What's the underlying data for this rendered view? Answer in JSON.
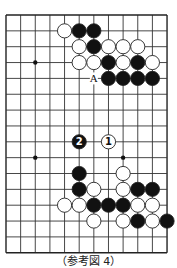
{
  "diagram": {
    "type": "go-board-fragment",
    "grid": {
      "columns": 12,
      "rows": 16,
      "origin_x": 6,
      "origin_y": 15,
      "step_x": 14.64,
      "step_y": 15.85,
      "line_color": "#333333",
      "border_color": "#222222"
    },
    "star_points": [
      {
        "col": 2,
        "row": 3
      },
      {
        "col": 2,
        "row": 9
      },
      {
        "col": 8,
        "row": 9
      }
    ],
    "stones": {
      "white": [
        {
          "col": 4,
          "row": 1
        },
        {
          "col": 5,
          "row": 2
        },
        {
          "col": 7,
          "row": 2
        },
        {
          "col": 8,
          "row": 2
        },
        {
          "col": 9,
          "row": 2
        },
        {
          "col": 5,
          "row": 3
        },
        {
          "col": 6,
          "row": 3
        },
        {
          "col": 8,
          "row": 3
        },
        {
          "col": 10,
          "row": 3
        },
        {
          "col": 7,
          "row": 8,
          "label": "1"
        },
        {
          "col": 8,
          "row": 10
        },
        {
          "col": 6,
          "row": 11
        },
        {
          "col": 8,
          "row": 11
        },
        {
          "col": 4,
          "row": 12
        },
        {
          "col": 5,
          "row": 12
        },
        {
          "col": 9,
          "row": 12
        },
        {
          "col": 10,
          "row": 12
        },
        {
          "col": 6,
          "row": 13
        },
        {
          "col": 8,
          "row": 13
        },
        {
          "col": 10,
          "row": 13
        }
      ],
      "black": [
        {
          "col": 5,
          "row": 1
        },
        {
          "col": 6,
          "row": 1
        },
        {
          "col": 6,
          "row": 2
        },
        {
          "col": 7,
          "row": 3
        },
        {
          "col": 9,
          "row": 3
        },
        {
          "col": 7,
          "row": 4
        },
        {
          "col": 8,
          "row": 4
        },
        {
          "col": 9,
          "row": 4
        },
        {
          "col": 10,
          "row": 4
        },
        {
          "col": 5,
          "row": 8,
          "label": "2"
        },
        {
          "col": 5,
          "row": 10
        },
        {
          "col": 5,
          "row": 11
        },
        {
          "col": 9,
          "row": 11
        },
        {
          "col": 10,
          "row": 11
        },
        {
          "col": 6,
          "row": 12
        },
        {
          "col": 7,
          "row": 12
        },
        {
          "col": 8,
          "row": 12
        },
        {
          "col": 9,
          "row": 13
        },
        {
          "col": 11,
          "row": 13
        }
      ]
    },
    "point_labels": [
      {
        "col": 6,
        "row": 4,
        "text": "A"
      }
    ],
    "colors": {
      "black_stone": "#111111",
      "white_stone": "#ffffff",
      "stone_outline": "#222222"
    },
    "caption": "（参考図 4）"
  }
}
